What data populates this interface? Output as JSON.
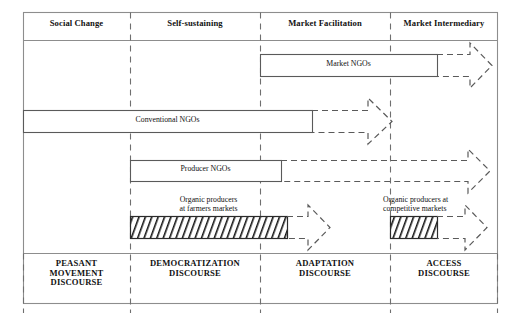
{
  "diagram": {
    "frame": {
      "x": 23,
      "y": 12,
      "w": 475,
      "h": 292
    },
    "header_row_bottom": 40,
    "discourse_row_top": 253,
    "column_dividers_x": [
      130,
      260,
      390
    ],
    "columns": [
      {
        "id": "social-change",
        "label": "Social Change",
        "center_x": 76
      },
      {
        "id": "self-sustaining",
        "label": "Self-sustaining",
        "center_x": 195
      },
      {
        "id": "market-facilitation",
        "label": "Market Facilitation",
        "center_x": 325
      },
      {
        "id": "market-intermediary",
        "label": "Market Intermediary",
        "center_x": 444
      }
    ],
    "discourses": [
      {
        "id": "peasant-movement",
        "label": "PEASANT\nMOVEMENT\nDISCOURSE",
        "center_x": 76
      },
      {
        "id": "democratization",
        "label": "DEMOCRATIZATION\nDISCOURSE",
        "center_x": 195
      },
      {
        "id": "adaptation",
        "label": "ADAPTATION\nDISCOURSE",
        "center_x": 325
      },
      {
        "id": "access",
        "label": "ACCESS\nDISCOURSE",
        "center_x": 444
      }
    ],
    "bars": [
      {
        "id": "market-ngos",
        "label": "Market NGOs",
        "fill": "none",
        "hatched": false,
        "x": 260,
        "y": 54,
        "w": 177,
        "h": 23,
        "arrow": {
          "from_x": 437,
          "tip_x": 492,
          "style": "dashed"
        }
      },
      {
        "id": "conventional-ngos",
        "label": "Conventional NGOs",
        "fill": "none",
        "hatched": false,
        "x": 23,
        "y": 110,
        "w": 289,
        "h": 23,
        "arrow": {
          "from_x": 312,
          "tip_x": 392,
          "style": "dashed"
        }
      },
      {
        "id": "producer-ngos",
        "label": "Producer NGOs",
        "fill": "none",
        "hatched": false,
        "x": 130,
        "y": 160,
        "w": 151,
        "h": 22,
        "arrow": {
          "from_x": 281,
          "tip_x": 492,
          "style": "dashed"
        }
      },
      {
        "id": "organic-producers-farmers-markets",
        "label": "",
        "above_label": "Organic producers\nat farmers markets",
        "fill": "hatch",
        "hatched": true,
        "x": 130,
        "y": 216,
        "w": 157,
        "h": 23,
        "arrow": {
          "from_x": 287,
          "tip_x": 330,
          "style": "dashed"
        }
      },
      {
        "id": "organic-producers-competitive-markets",
        "label": "",
        "above_label": "Organic producers at\ncompetitive markets",
        "fill": "hatch",
        "hatched": true,
        "x": 390,
        "y": 216,
        "w": 47,
        "h": 23,
        "arrow": {
          "from_x": 437,
          "tip_x": 487,
          "style": "dashed"
        }
      }
    ],
    "colors": {
      "frame_stroke": "#8d8d8d",
      "bar_stroke": "#5a5a5a",
      "divider_stroke": "#6f6f6f",
      "arrow_stroke": "#5a5a5a",
      "hatch_fill": "#1c1c1c",
      "text": "#111111",
      "background": "#ffffff"
    }
  }
}
